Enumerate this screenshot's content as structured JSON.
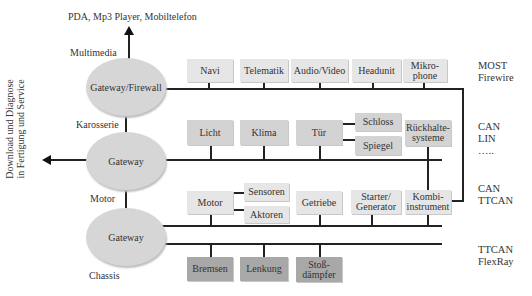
{
  "diagram": {
    "top_label": "PDA, Mp3 Player, Mobiltelefon",
    "side_label_line1": "Download und Diagnose",
    "side_label_line2": "in Fertigung und Service",
    "domain_labels": {
      "multimedia": "Multimedia",
      "karosserie": "Karosserie",
      "motor": "Motor",
      "chassis": "Chassis"
    },
    "gateways": [
      {
        "label": "Gateway/Firewall"
      },
      {
        "label": "Gateway"
      },
      {
        "label": "Gateway"
      }
    ],
    "bus_labels": {
      "multimedia": {
        "line1": "MOST",
        "line2": "Firewire"
      },
      "body": {
        "line1": "CAN",
        "line2": "LIN",
        "line3": "….."
      },
      "powertrain": {
        "line1": "CAN",
        "line2": "TTCAN"
      },
      "chassis": {
        "line1": "TTCAN",
        "line2": "FlexRay"
      }
    },
    "multimedia_nodes": [
      {
        "label": "Navi"
      },
      {
        "label": "Telematik"
      },
      {
        "label": "Audio/Video"
      },
      {
        "label": "Headunit"
      },
      {
        "label_line1": "Mikro-",
        "label_line2": "phone"
      }
    ],
    "body_nodes": [
      {
        "label": "Licht"
      },
      {
        "label": "Klima"
      },
      {
        "label": "Tür"
      },
      {
        "label": "Schloss"
      },
      {
        "label": "Spiegel"
      },
      {
        "label_line1": "Rückhalte-",
        "label_line2": "systeme"
      }
    ],
    "powertrain_nodes": [
      {
        "label": "Motor"
      },
      {
        "label": "Sensoren"
      },
      {
        "label": "Aktoren"
      },
      {
        "label": "Getriebe"
      },
      {
        "label_line1": "Starter/",
        "label_line2": "Generator"
      },
      {
        "label_line1": "Kombi-",
        "label_line2": "instrument"
      }
    ],
    "chassis_nodes": [
      {
        "label": "Bremsen"
      },
      {
        "label": "Lenkung"
      },
      {
        "label_line1": "Stoß-",
        "label_line2": "dämpfer"
      }
    ],
    "colors": {
      "multimedia_box": "#e6e6e6",
      "body_box": "#d3d3d3",
      "powertrain_box": "#e6e6e6",
      "chassis_box": "#a8a8a8",
      "gateway": "#d6d6d6",
      "line": "#222222"
    }
  }
}
